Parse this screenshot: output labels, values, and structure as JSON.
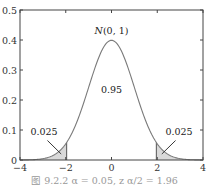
{
  "chart_data": {
    "type": "area",
    "title": "",
    "curve_label": "N(0, 1)",
    "xlabel": "",
    "ylabel": "",
    "xlim": [
      -4,
      4
    ],
    "ylim": [
      0,
      0.5
    ],
    "x_ticks": [
      "-4",
      "-2",
      "0",
      "2",
      "4"
    ],
    "y_ticks": [
      "0",
      "0.1",
      "0.2",
      "0.3",
      "0.4",
      "0.5"
    ],
    "grid": false,
    "series": [
      {
        "name": "N(0, 1) density",
        "function": "standard normal pdf",
        "peak": 0.399
      }
    ],
    "shaded_regions": [
      {
        "from": -4,
        "to": -1.96,
        "area": 0.025
      },
      {
        "from": 1.96,
        "to": 4,
        "area": 0.025
      }
    ],
    "annotations": [
      {
        "text": "0.95",
        "x": 0,
        "y": 0.23
      },
      {
        "text": "0.025",
        "x": -2.9,
        "y": 0.08
      },
      {
        "text": "0.025",
        "x": 2.9,
        "y": 0.08
      },
      {
        "text": "N(0, 1)",
        "x": 0,
        "y": 0.42
      }
    ],
    "caption": "图 9.2.2   α = 0.05,  z_{α/2} = 1.96"
  },
  "labels": {
    "curve": "N(0, 1)",
    "center_area": "0.95",
    "left_tail": "0.025",
    "right_tail": "0.025",
    "caption": "图 9.2.2   α = 0.05,  z α/2 = 1.96"
  },
  "colors": {
    "curve": "#7a7a7a",
    "fill": "#d9d9d9",
    "axis": "#444444"
  }
}
